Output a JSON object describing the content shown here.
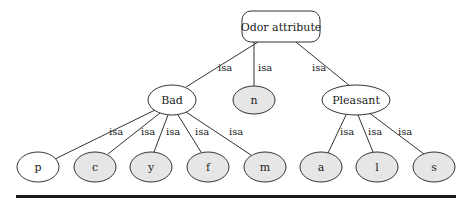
{
  "colors": {
    "unshaded_fill": "#ffffff",
    "shaded_fill": "#e6e6e6",
    "stroke": "#333333",
    "rule": "#1a1a1a"
  },
  "root": {
    "label": "Odor attribute",
    "shape": "rounded-rect",
    "shaded": false
  },
  "edge_label": "isa",
  "level1": [
    {
      "id": "bad",
      "label": "Bad",
      "shaded": false
    },
    {
      "id": "n",
      "label": "n",
      "shaded": true
    },
    {
      "id": "pleasant",
      "label": "Pleasant",
      "shaded": false
    }
  ],
  "leaves": [
    {
      "id": "p",
      "label": "p",
      "parent": "Bad",
      "shaded": false
    },
    {
      "id": "c",
      "label": "c",
      "parent": "Bad",
      "shaded": true
    },
    {
      "id": "y",
      "label": "y",
      "parent": "Bad",
      "shaded": true
    },
    {
      "id": "f",
      "label": "f",
      "parent": "Bad",
      "shaded": true
    },
    {
      "id": "m",
      "label": "m",
      "parent": "Bad",
      "shaded": true
    },
    {
      "id": "a",
      "label": "a",
      "parent": "Pleasant",
      "shaded": true
    },
    {
      "id": "l",
      "label": "l",
      "parent": "Pleasant",
      "shaded": true
    },
    {
      "id": "s",
      "label": "s",
      "parent": "Pleasant",
      "shaded": true
    }
  ],
  "edges": [
    {
      "from": "Odor attribute",
      "to": "Bad",
      "label": "isa"
    },
    {
      "from": "Odor attribute",
      "to": "n",
      "label": "isa"
    },
    {
      "from": "Odor attribute",
      "to": "Pleasant",
      "label": "isa"
    },
    {
      "from": "Bad",
      "to": "p",
      "label": "isa"
    },
    {
      "from": "Bad",
      "to": "c",
      "label": "isa"
    },
    {
      "from": "Bad",
      "to": "y",
      "label": "isa"
    },
    {
      "from": "Bad",
      "to": "f",
      "label": "isa"
    },
    {
      "from": "Bad",
      "to": "m",
      "label": "isa"
    },
    {
      "from": "Pleasant",
      "to": "a",
      "label": "isa"
    },
    {
      "from": "Pleasant",
      "to": "l",
      "label": "isa"
    },
    {
      "from": "Pleasant",
      "to": "s",
      "label": "isa"
    }
  ]
}
